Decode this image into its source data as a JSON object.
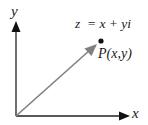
{
  "diagram": {
    "axes": {
      "x_label": "x",
      "y_label": "y"
    },
    "equation": "z  = x + yi",
    "point_label": "P(x,y)",
    "colors": {
      "axis": "#222222",
      "vector": "#808080",
      "point": "#111111",
      "text": "#1a1a1a"
    }
  }
}
